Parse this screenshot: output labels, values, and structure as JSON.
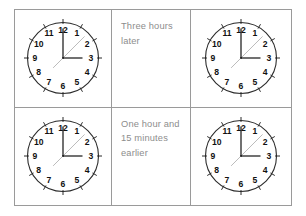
{
  "worksheet": {
    "title": "Clock time difference worksheet",
    "background_color": "#ffffff",
    "border_color": "#9a9a9a",
    "text_color": "#8d8d8d",
    "clock_ink_color": "#2b2b2b"
  },
  "grid": {
    "columns": 3,
    "rows": 2
  },
  "prompts": {
    "row1": "Three hours later",
    "row2": "One hour and 15 minutes earlier"
  },
  "clock_face": {
    "numerals": [
      "1",
      "2",
      "3",
      "4",
      "5",
      "6",
      "7",
      "8",
      "9",
      "10",
      "11",
      "12"
    ],
    "tick_count": 12,
    "has_second_hand": true
  },
  "clocks": [
    {
      "id": "clock-top-left",
      "position": "row1-col1",
      "label": "Start time clock, row 1",
      "hour_hand_deg": 90,
      "minute_hand_deg": 0,
      "second_hand_deg": 45,
      "reading": "3:00"
    },
    {
      "id": "clock-top-right",
      "position": "row1-col3",
      "label": "Answer clock, row 1",
      "hour_hand_deg": 90,
      "minute_hand_deg": 0,
      "second_hand_deg": 45,
      "reading": "3:00"
    },
    {
      "id": "clock-bottom-left",
      "position": "row2-col1",
      "label": "Start time clock, row 2",
      "hour_hand_deg": 90,
      "minute_hand_deg": 0,
      "second_hand_deg": 45,
      "reading": "3:00"
    },
    {
      "id": "clock-bottom-right",
      "position": "row2-col3",
      "label": "Answer clock, row 2",
      "hour_hand_deg": 90,
      "minute_hand_deg": 0,
      "second_hand_deg": 45,
      "reading": "3:00"
    }
  ]
}
